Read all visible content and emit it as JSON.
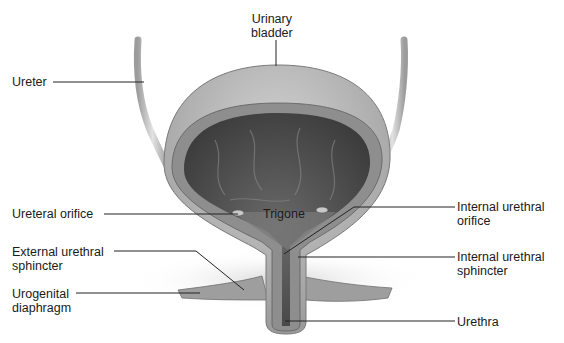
{
  "figure": {
    "colors": {
      "background": "#ffffff",
      "label_text": "#1a1a1a",
      "leader_line": "#222222",
      "bladder_outer": "#b9b9b9",
      "bladder_lumen": "#4a4a4a",
      "muscle_wall": "#8c8c8c"
    }
  },
  "labels": {
    "urinary_bladder": "Urinary\nbladder",
    "ureter": "Ureter",
    "ureteral_orifice": "Ureteral orifice",
    "trigone": "Trigone",
    "internal_urethral_orifice": "Internal urethral\norifice",
    "external_urethral_sphincter": "External urethral\nsphincter",
    "internal_urethral_sphincter": "Internal urethral\nsphincter",
    "urogenital_diaphragm": "Urogenital\ndiaphragm",
    "urethra": "Urethra"
  }
}
